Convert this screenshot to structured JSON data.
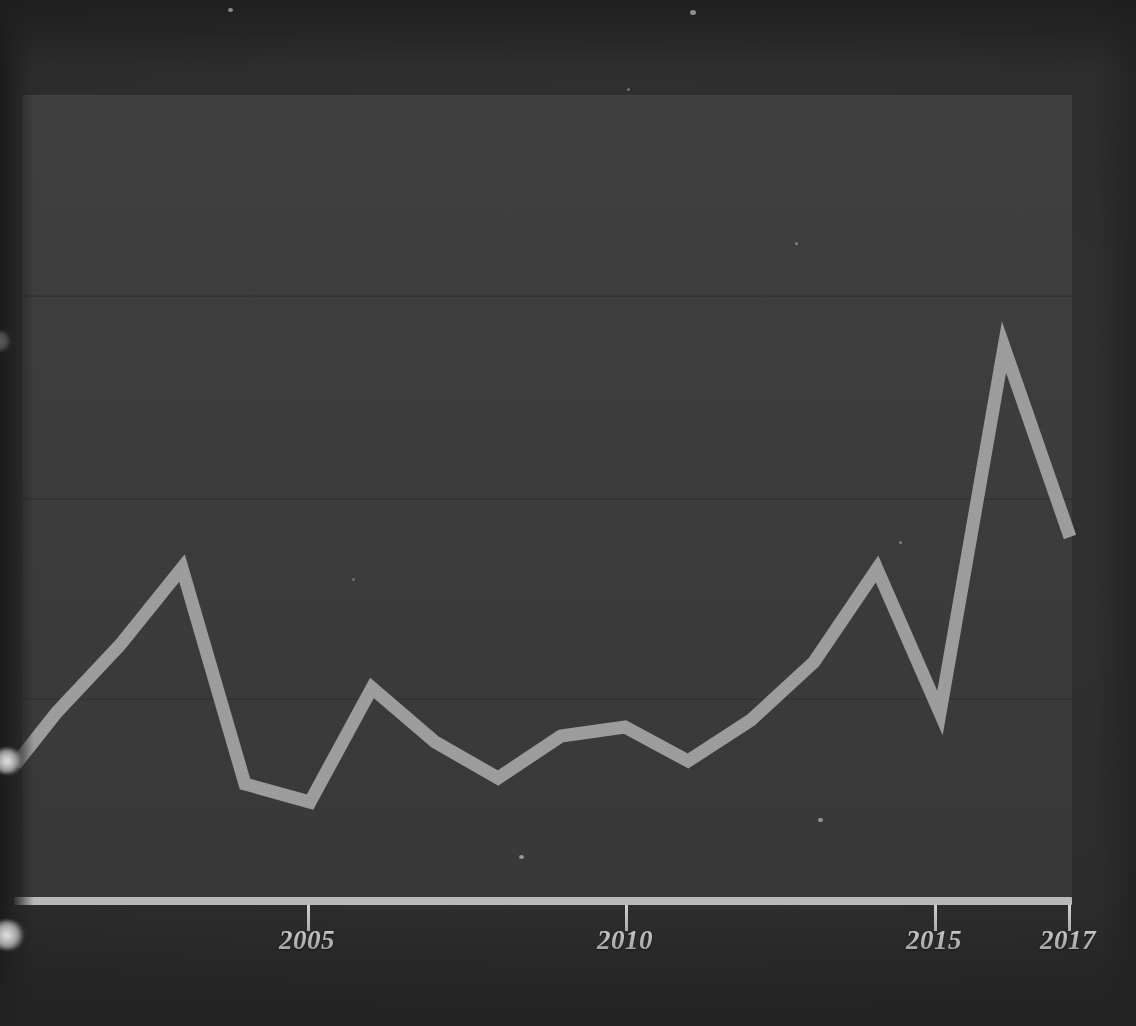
{
  "figure": {
    "kind": "scanned-line-chart",
    "background_color": "#2f2f2f",
    "panel_color": "#3c3c3c",
    "line_color": "#9c9c9c",
    "axis_color": "#b9b9b9",
    "tick_label_color": "#f0f0f0"
  },
  "axis": {
    "ticks": [
      {
        "label": "2005",
        "x": 307
      },
      {
        "label": "2010",
        "x": 625
      },
      {
        "label": "2015",
        "x": 934
      },
      {
        "label": "2017",
        "x": 1068
      }
    ]
  },
  "gridlines": [
    {
      "y": 295
    },
    {
      "y": 498
    },
    {
      "y": 698
    }
  ],
  "chart_data": {
    "type": "line",
    "title": "",
    "subtitle": "",
    "xlabel": "",
    "ylabel": "",
    "legend": [],
    "grid": true,
    "legend_position": "none",
    "x_tick_labels": [
      "2005",
      "2010",
      "2015",
      "2017"
    ],
    "y_tick_labels": [],
    "xlim": [
      2000,
      2017
    ],
    "ylim": [
      0,
      100
    ],
    "note": "y axis is unlabeled; values below are estimated from pixel heights against the three faint gridlines (y=295, 498, 698) and the baseline axis at y=901",
    "x": [
      2000,
      2001,
      2002,
      2003,
      2004,
      2005,
      2006,
      2007,
      2008,
      2009,
      2010,
      2011,
      2012,
      2013,
      2014,
      2015,
      2016,
      2017
    ],
    "series": [
      {
        "name": "series-1",
        "values": [
          22,
          31,
          41,
          55,
          19,
          16,
          32,
          25,
          20,
          25,
          27,
          21,
          27,
          35,
          55,
          29,
          82,
          58
        ]
      }
    ],
    "pixel_points": [
      {
        "x": 15,
        "y": 765
      },
      {
        "x": 57,
        "y": 712
      },
      {
        "x": 120,
        "y": 645
      },
      {
        "x": 182,
        "y": 568
      },
      {
        "x": 245,
        "y": 784
      },
      {
        "x": 310,
        "y": 802
      },
      {
        "x": 372,
        "y": 688
      },
      {
        "x": 435,
        "y": 742
      },
      {
        "x": 498,
        "y": 778
      },
      {
        "x": 561,
        "y": 736
      },
      {
        "x": 625,
        "y": 727
      },
      {
        "x": 688,
        "y": 761
      },
      {
        "x": 751,
        "y": 720
      },
      {
        "x": 814,
        "y": 662
      },
      {
        "x": 877,
        "y": 569
      },
      {
        "x": 940,
        "y": 713
      },
      {
        "x": 1004,
        "y": 347
      },
      {
        "x": 1070,
        "y": 537
      }
    ]
  }
}
